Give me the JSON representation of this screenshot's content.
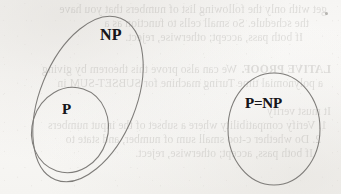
{
  "page": {
    "kind": "scanned-book-page-figure",
    "background_color": "#f8f7f5",
    "ink_color": "#17161a",
    "outline_color": "#7e7c79"
  },
  "diagram": {
    "type": "set-venn",
    "sets": [
      {
        "id": "np",
        "label": "NP",
        "shape": "ellipse",
        "cx": 88,
        "cy": 99,
        "rx": 48,
        "ry": 87,
        "rotation_deg": 22,
        "contains": [
          "p"
        ]
      },
      {
        "id": "p",
        "label": "P",
        "shape": "ellipse",
        "cx": 70,
        "cy": 130,
        "rx": 38,
        "ry": 43,
        "rotation_deg": 18,
        "contains": []
      },
      {
        "id": "p-equals-np",
        "label": "P=NP",
        "shape": "ellipse",
        "cx": 274,
        "cy": 129,
        "rx": 46,
        "ry": 56,
        "rotation_deg": 0,
        "contains": []
      }
    ]
  },
  "bleedthrough": {
    "note": "faint mirrored text showing through from the reverse side of the page",
    "opacity": 0.165,
    "lines": [
      {
        "text": "get with only the following list of numbers that you have",
        "x": 14,
        "y": 3,
        "style": "normal"
      },
      {
        "text": "the schedule. So small cells to function as a",
        "x": 32,
        "y": 17,
        "style": "normal"
      },
      {
        "text": "If both pass, accept; otherwise, reject.",
        "x": 38,
        "y": 31,
        "style": "normal"
      },
      {
        "text": "LATIVE PROOF.",
        "x": 10,
        "y": 63,
        "style": "caps"
      },
      {
        "text": "We can also prove this theorem by giving",
        "x": 104,
        "y": 63,
        "style": "normal"
      },
      {
        "text": "a polynomial time Turing machine for SUBSET-SUM in",
        "x": 18,
        "y": 77,
        "style": "normal"
      },
      {
        "text": "It must verify",
        "x": 10,
        "y": 105,
        "style": "normal"
      },
      {
        "text": "1. Verify compatibility where a subset of the input numbers",
        "x": 14,
        "y": 119,
        "style": "normal"
      },
      {
        "text": "2. Do whether c-too small sum of number, and state to",
        "x": 20,
        "y": 133,
        "style": "normal"
      },
      {
        "text": "If both pass, accept; otherwise, reject.",
        "x": 28,
        "y": 147,
        "style": "normal"
      }
    ],
    "marks": [
      {
        "x": 325,
        "y": 12
      }
    ]
  }
}
